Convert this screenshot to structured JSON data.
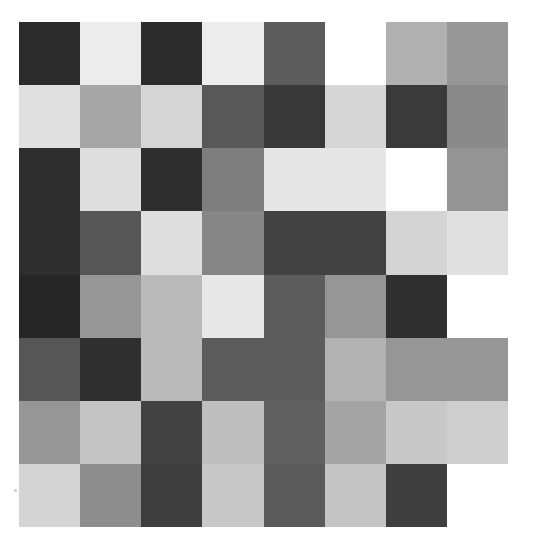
{
  "figure": {
    "type": "heatmap-grid",
    "background_color": "#ffffff",
    "rows": 8,
    "columns": 8,
    "origin_x": 19,
    "origin_y": 22,
    "cell_width": 61,
    "cell_height": 63
  },
  "chart_data": {
    "type": "heatmap",
    "subtitle": "",
    "xlabel": "",
    "ylabel": "",
    "grid": false,
    "legend": "none",
    "x": [
      "c1",
      "c2",
      "c3",
      "c4",
      "c5",
      "c6",
      "c7",
      "c8"
    ],
    "y": [
      "r1",
      "r2",
      "r3",
      "r4",
      "r5",
      "r6",
      "r7",
      "r8"
    ],
    "colormap": "gray",
    "vmin": 0,
    "vmax": 255,
    "xticklabels": [],
    "yticklabels": [],
    "values": [
      [
        44,
        236,
        44,
        236,
        92,
        255,
        176,
        150
      ],
      [
        224,
        166,
        214,
        88,
        56,
        214,
        58,
        138
      ],
      [
        46,
        222,
        46,
        126,
        230,
        230,
        255,
        148
      ],
      [
        46,
        86,
        222,
        134,
        66,
        66,
        212,
        224
      ],
      [
        38,
        150,
        186,
        232,
        92,
        150,
        48,
        255
      ],
      [
        86,
        48,
        186,
        92,
        92,
        178,
        150,
        150
      ],
      [
        150,
        196,
        66,
        190,
        96,
        164,
        200,
        206
      ],
      [
        212,
        142,
        62,
        200,
        90,
        196,
        62,
        255
      ]
    ],
    "colors": [
      [
        "#2c2c2c",
        "#ececec",
        "#2c2c2c",
        "#ececec",
        "#5c5c5c",
        "#ffffff",
        "#b0b0b0",
        "#969696"
      ],
      [
        "#e0e0e0",
        "#a6a6a6",
        "#d6d6d6",
        "#585858",
        "#383838",
        "#d6d6d6",
        "#3a3a3a",
        "#8a8a8a"
      ],
      [
        "#2e2e2e",
        "#dedede",
        "#2e2e2e",
        "#7e7e7e",
        "#e6e6e6",
        "#e6e6e6",
        "#ffffff",
        "#949494"
      ],
      [
        "#2e2e2e",
        "#565656",
        "#dedede",
        "#868686",
        "#424242",
        "#424242",
        "#d4d4d4",
        "#e0e0e0"
      ],
      [
        "#262626",
        "#969696",
        "#bababa",
        "#e8e8e8",
        "#5c5c5c",
        "#969696",
        "#303030",
        "#ffffff"
      ],
      [
        "#565656",
        "#303030",
        "#bababa",
        "#5c5c5c",
        "#5c5c5c",
        "#b2b2b2",
        "#969696",
        "#969696"
      ],
      [
        "#969696",
        "#c4c4c4",
        "#424242",
        "#bebebe",
        "#606060",
        "#a4a4a4",
        "#c8c8c8",
        "#cecece"
      ],
      [
        "#d4d4d4",
        "#8e8e8e",
        "#3e3e3e",
        "#c8c8c8",
        "#5a5a5a",
        "#c4c4c4",
        "#3e3e3e",
        "#ffffff"
      ]
    ]
  },
  "artifacts": {
    "speck": {
      "x": 14,
      "y": 489
    }
  }
}
